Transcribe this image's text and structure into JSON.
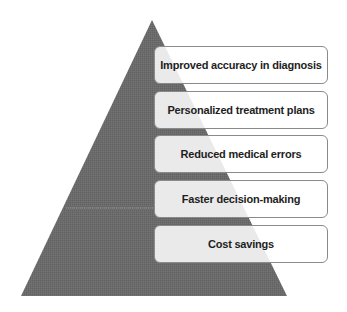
{
  "diagram": {
    "type": "pyramid",
    "colors": {
      "pyramid_fill": "#6b6b6b",
      "box_border": "#8a8a8a",
      "box_fill": "#ffffff",
      "text": "#1e1e1e"
    },
    "levels": [
      {
        "label": "Improved accuracy in diagnosis"
      },
      {
        "label": "Personalized treatment plans"
      },
      {
        "label": "Reduced medical errors"
      },
      {
        "label": "Faster decision-making"
      },
      {
        "label": "Cost savings"
      }
    ]
  }
}
